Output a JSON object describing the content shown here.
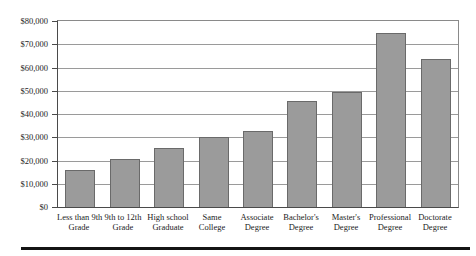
{
  "chart_data": {
    "type": "bar",
    "title": "",
    "xlabel": "",
    "ylabel": "",
    "categories": [
      "Less than 9th Grade",
      "9th to 12th Grade",
      "High school Graduate",
      "Same College",
      "Associate Degree",
      "Bachelor's Degree",
      "Master's Degree",
      "Professional Degree",
      "Doctorate Degree"
    ],
    "category_label_lines": [
      [
        "Less than 9th",
        "Grade"
      ],
      [
        "9th to 12th",
        "Grade"
      ],
      [
        "High school",
        "Graduate"
      ],
      [
        "Same",
        "College"
      ],
      [
        "Associate",
        "Degree"
      ],
      [
        "Bachelor's",
        "Degree"
      ],
      [
        "Master's",
        "Degree"
      ],
      [
        "Professional",
        "Degree"
      ],
      [
        "Doctorate",
        "Degree"
      ]
    ],
    "values": [
      16000,
      20500,
      25500,
      30000,
      32500,
      45500,
      49500,
      75000,
      63500
    ],
    "ylim": [
      0,
      80000
    ],
    "ytick_interval": 10000,
    "ytick_labels": [
      "$0",
      "$10,000",
      "$20,000",
      "$30,000",
      "$40,000",
      "$50,000",
      "$60,000",
      "$70,000",
      "$80,000"
    ],
    "grid": true,
    "legend": "none",
    "colors": {
      "bar_fill": "#9b9b9b",
      "bar_border": "#6a6a6a",
      "gridline": "#9a9a9a",
      "axis": "#4a4a4a",
      "frame": "#8a8a8a",
      "text": "#1c1c1c",
      "bottom_rule": "#141414"
    }
  }
}
